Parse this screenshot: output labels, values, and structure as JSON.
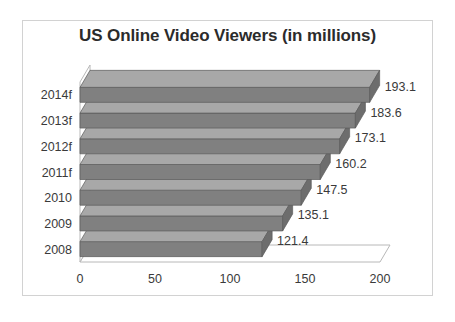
{
  "chart_data": {
    "type": "bar",
    "orientation": "horizontal",
    "style": "3d",
    "title": "US Online Video Viewers (in millions)",
    "xlabel": "",
    "ylabel": "",
    "categories": [
      "2008",
      "2009",
      "2010",
      "2011f",
      "2012f",
      "2013f",
      "2014f"
    ],
    "values": [
      121.4,
      135.1,
      147.5,
      160.2,
      173.1,
      183.6,
      193.1
    ],
    "data_labels": [
      "121.4",
      "135.1",
      "147.5",
      "160.2",
      "173.1",
      "183.6",
      "193.1"
    ],
    "xlim": [
      0,
      200
    ],
    "xticks": [
      0,
      50,
      100,
      150,
      200
    ],
    "xtick_labels": [
      "0",
      "50",
      "100",
      "150",
      "200"
    ],
    "grid": false,
    "legend": false,
    "series": [
      {
        "name": "US Online Video Viewers",
        "values": [
          121.4,
          135.1,
          147.5,
          160.2,
          173.1,
          183.6,
          193.1
        ]
      }
    ],
    "display_order_top_to_bottom": [
      "2014f",
      "2013f",
      "2012f",
      "2011f",
      "2010",
      "2009",
      "2008"
    ],
    "colors": {
      "bar_fill": "#808080",
      "bar_top": "#a8a8a8",
      "bar_side": "#6d6d6d",
      "bar_outline": "#5a5a5a",
      "axis_line": "#b8b8b8",
      "text": "#3a3a3a",
      "title_text": "#2b2b2b",
      "frame": "#d2d2d2",
      "background": "#ffffff"
    }
  }
}
